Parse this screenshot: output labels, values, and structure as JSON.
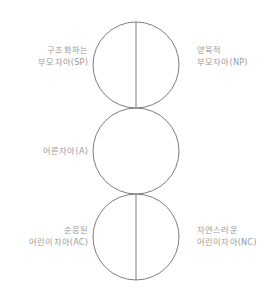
{
  "diagram": {
    "type": "ego-state-pac-diagram",
    "background_color": "#ffffff",
    "stroke_color": "#6f6f6f",
    "text_color": "#9a9a9a",
    "circles": [
      {
        "id": "parent",
        "center_x": 136,
        "center_y": 65,
        "radius": 43,
        "divided": true
      },
      {
        "id": "adult",
        "center_x": 136,
        "center_y": 151,
        "radius": 43,
        "divided": false
      },
      {
        "id": "child",
        "center_x": 136,
        "center_y": 237,
        "radius": 43,
        "divided": true
      }
    ],
    "labels": {
      "structuring_parent": {
        "line1": "구조화하는",
        "line2": "부모자아(SP)",
        "side": "left",
        "circle": "parent"
      },
      "nurturing_parent": {
        "line1": "양육적",
        "line2": "부모자아(NP)",
        "side": "right",
        "circle": "parent"
      },
      "adult": {
        "line1": "어른자아(A)",
        "line2": "",
        "side": "left",
        "circle": "adult"
      },
      "adapted_child": {
        "line1": "순응된",
        "line2": "어린이자아(AC)",
        "side": "left",
        "circle": "child"
      },
      "natural_child": {
        "line1": "자연스러운",
        "line2": "어린이자아(NC)",
        "side": "right",
        "circle": "child"
      }
    }
  }
}
